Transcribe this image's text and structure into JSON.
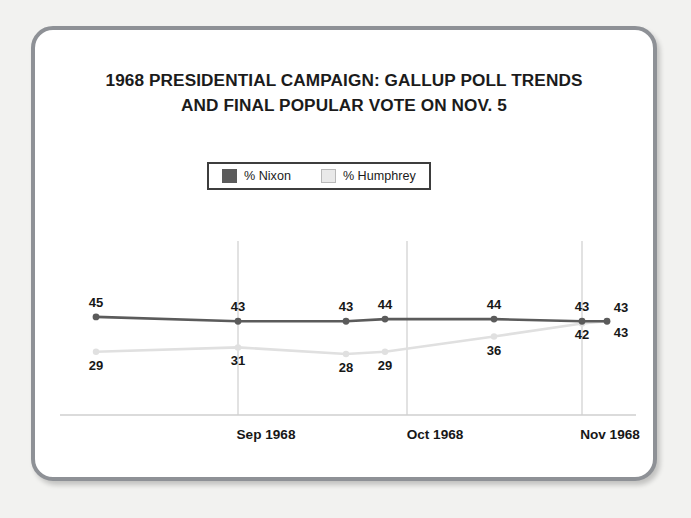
{
  "chart_data": {
    "type": "line",
    "title": "1968 PRESIDENTIAL CAMPAIGN: GALLUP POLL TRENDS AND FINAL POPULAR VOTE ON NOV. 5",
    "title_lines": [
      "1968 PRESIDENTIAL CAMPAIGN: GALLUP POLL TRENDS",
      "AND FINAL POPULAR VOTE ON NOV. 5"
    ],
    "xlabel": "",
    "ylabel": "",
    "ylim": [
      0,
      50
    ],
    "grid": "vertical",
    "legend_position": "top-center",
    "categories": [
      "",
      "Sep 1968",
      "",
      "",
      "",
      "Nov 1968",
      ""
    ],
    "tick_labels": [
      "Sep 1968",
      "Oct 1968",
      "Nov 1968"
    ],
    "series": [
      {
        "name": "% Nixon",
        "color": "#5b5b5b",
        "values": [
          45,
          43,
          43,
          44,
          44,
          43,
          43
        ],
        "label_position": "above"
      },
      {
        "name": "% Humphrey",
        "color": "#e0e0e0",
        "values": [
          29,
          31,
          28,
          29,
          36,
          42,
          43
        ],
        "label_position": "below"
      }
    ]
  },
  "legend": {
    "entries": [
      {
        "label": "% Nixon",
        "swatch": "nixon"
      },
      {
        "label": "% Humphrey",
        "swatch": "humphrey"
      }
    ]
  },
  "axis": {
    "ticks": [
      {
        "label": "Sep 1968"
      },
      {
        "label": "Oct 1968"
      },
      {
        "label": "Nov 1968"
      }
    ]
  },
  "colors": {
    "nixon": "#5b5b5b",
    "humphrey": "#e0e0e0",
    "frame": "#8e9196",
    "background": "#ffffff",
    "page_background": "#f2f2f0",
    "axis": "#cfcfcf",
    "text": "#171717"
  }
}
